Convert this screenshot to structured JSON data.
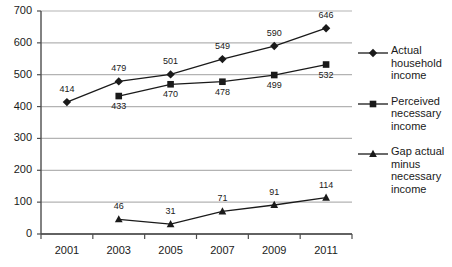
{
  "chart_data": {
    "type": "line",
    "title": "",
    "xlabel": "",
    "ylabel": "",
    "categories": [
      "2001",
      "2003",
      "2005",
      "2007",
      "2009",
      "2011"
    ],
    "ylim": [
      0,
      700
    ],
    "y_ticks": [
      0,
      100,
      200,
      300,
      400,
      500,
      600,
      700
    ],
    "grid": true,
    "legend_position": "right",
    "series": [
      {
        "name": "Actual household income",
        "marker": "diamond",
        "label_position": "above",
        "values": [
          414,
          479,
          501,
          549,
          590,
          646
        ]
      },
      {
        "name": "Perceived necessary income",
        "marker": "square",
        "label_position": "below",
        "values": [
          null,
          433,
          470,
          478,
          499,
          532
        ]
      },
      {
        "name": "Gap actual minus necessary income",
        "marker": "triangle",
        "label_position": "above",
        "values": [
          null,
          46,
          31,
          71,
          91,
          114
        ]
      }
    ]
  },
  "colors": {
    "line": "#1a1a1a",
    "grid": "#b3b3b3",
    "axis": "#4d4d4d",
    "text": "#1a1a1a",
    "background": "#ffffff"
  },
  "legend": {
    "items": [
      {
        "label": "Actual household income",
        "marker": "diamond-marker"
      },
      {
        "label": "Perceived necessary income",
        "marker": "square-marker"
      },
      {
        "label": "Gap actual minus necessary income",
        "marker": "triangle-marker"
      }
    ]
  }
}
